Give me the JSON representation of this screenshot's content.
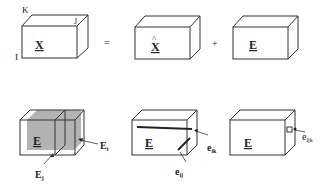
{
  "row1": {
    "box_x": {
      "label": "X",
      "axis_k": "K",
      "axis_j": "J",
      "axis_i": "I"
    },
    "equals": "=",
    "box_xhat": {
      "label": "X",
      "hat": "^"
    },
    "plus": "+",
    "box_e": {
      "label": "E"
    }
  },
  "row2": {
    "box_slices": {
      "label": "E",
      "slice_i": {
        "base": "E",
        "sub": "i"
      },
      "slice_j": {
        "base": "E",
        "sub": "j"
      }
    },
    "box_fibers": {
      "label": "E",
      "fiber_ik": {
        "base": "e",
        "sub": "ik"
      },
      "fiber_ij": {
        "base": "e",
        "sub": "ij"
      }
    },
    "box_element": {
      "label": "E",
      "element_ijk": {
        "base": "e",
        "sub": "ijk"
      }
    }
  },
  "colors": {
    "stroke": "#333333",
    "slice_fill": "#b3b3b3",
    "bg": "#ffffff"
  }
}
